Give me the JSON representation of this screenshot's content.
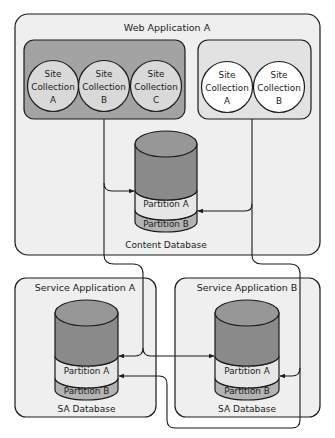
{
  "diagram": {
    "colors": {
      "background": "#ffffff",
      "container_fill": "#efefef",
      "group_dark_fill": "#a3a3a3",
      "group_light_fill": "#e2e2e2",
      "circle_dark_fill": "#d9d9d9",
      "circle_light_fill": "#ffffff",
      "db_top": "#979797",
      "db_body": "#8a8a8a",
      "partition_a": "#e6e6e6",
      "partition_b": "#b3b3b3",
      "stroke": "#1a1a1a"
    },
    "web_application": {
      "title": "Web Application A",
      "group_1": {
        "site_collections": [
          {
            "line1": "Site",
            "line2": "Collection",
            "line3": "A"
          },
          {
            "line1": "Site",
            "line2": "Collection",
            "line3": "B"
          },
          {
            "line1": "Site",
            "line2": "Collection",
            "line3": "C"
          }
        ]
      },
      "group_2": {
        "site_collections": [
          {
            "line1": "Site",
            "line2": "Collection",
            "line3": "A"
          },
          {
            "line1": "Site",
            "line2": "Collection",
            "line3": "B"
          }
        ]
      },
      "content_database": {
        "partition_a": "Partition A",
        "partition_b": "Partition B",
        "label": "Content Database"
      }
    },
    "service_applications": [
      {
        "title": "Service Application A",
        "database": {
          "partition_a": "Partition A",
          "partition_b": "Partition B",
          "label": "SA Database"
        }
      },
      {
        "title": "Service Application B",
        "database": {
          "partition_a": "Partition A",
          "partition_b": "Partition B",
          "label": "SA Database"
        }
      }
    ]
  }
}
